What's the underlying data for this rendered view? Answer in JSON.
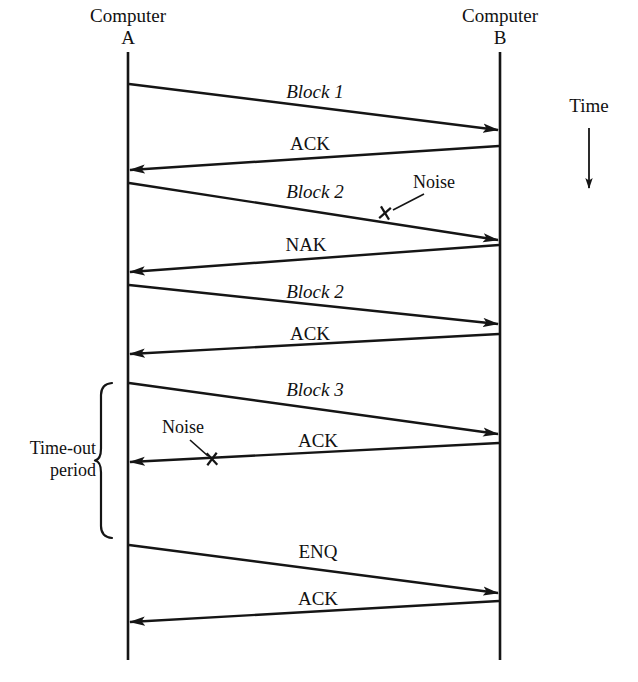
{
  "diagram": {
    "background_color": "#ffffff",
    "ink_color": "#151515",
    "participants": [
      {
        "id": "A",
        "name_line1": "Computer",
        "name_line2": "A",
        "x": 128
      },
      {
        "id": "B",
        "name_line1": "Computer",
        "name_line2": "B",
        "x": 500
      }
    ],
    "time_axis": {
      "label": "Time",
      "direction": "down",
      "x": 589,
      "label_y": 112,
      "arrow_from_y": 128,
      "arrow_to_y": 188
    },
    "messages": [
      {
        "id": "m1",
        "label": "Block 1",
        "style": "italic",
        "from": "A",
        "to": "B",
        "from_y": 84,
        "to_y": 130,
        "label_x": 315,
        "label_y": 98,
        "corrupted": false
      },
      {
        "id": "m2",
        "label": "ACK",
        "style": "roman",
        "from": "B",
        "to": "A",
        "from_y": 146,
        "to_y": 170,
        "label_x": 310,
        "label_y": 150,
        "corrupted": false
      },
      {
        "id": "m3",
        "label": "Block 2",
        "style": "italic",
        "from": "A",
        "to": "B",
        "from_y": 183,
        "to_y": 240,
        "label_x": 315,
        "label_y": 198,
        "corrupted": true,
        "noise": {
          "label": "Noise",
          "mark_x": 385,
          "mark_y": 213,
          "label_x": 434,
          "label_y": 188,
          "leader_from_x": 424,
          "leader_from_y": 194,
          "leader_to_x": 393,
          "leader_to_y": 210
        }
      },
      {
        "id": "m4",
        "label": "NAK",
        "style": "roman",
        "from": "B",
        "to": "A",
        "from_y": 245,
        "to_y": 272,
        "label_x": 306,
        "label_y": 251,
        "corrupted": false
      },
      {
        "id": "m5",
        "label": "Block 2",
        "style": "italic",
        "from": "A",
        "to": "B",
        "from_y": 285,
        "to_y": 324,
        "label_x": 315,
        "label_y": 298,
        "corrupted": false
      },
      {
        "id": "m6",
        "label": "ACK",
        "style": "roman",
        "from": "B",
        "to": "A",
        "from_y": 334,
        "to_y": 354,
        "label_x": 310,
        "label_y": 340,
        "corrupted": false
      },
      {
        "id": "m7",
        "label": "Block 3",
        "style": "italic",
        "from": "A",
        "to": "B",
        "from_y": 383,
        "to_y": 434,
        "label_x": 315,
        "label_y": 396,
        "corrupted": false
      },
      {
        "id": "m8",
        "label": "ACK",
        "style": "roman",
        "from": "B",
        "to": "A",
        "from_y": 443,
        "to_y": 462,
        "label_x": 318,
        "label_y": 447,
        "corrupted": true,
        "noise": {
          "label": "Noise",
          "mark_x": 212,
          "mark_y": 459,
          "label_x": 183,
          "label_y": 433,
          "leader_from_x": 190,
          "leader_from_y": 440,
          "leader_to_x": 208,
          "leader_to_y": 456
        }
      },
      {
        "id": "m9",
        "label": "ENQ",
        "style": "roman",
        "from": "A",
        "to": "B",
        "from_y": 545,
        "to_y": 593,
        "label_x": 318,
        "label_y": 558,
        "corrupted": false
      },
      {
        "id": "m10",
        "label": "ACK",
        "style": "roman",
        "from": "B",
        "to": "A",
        "from_y": 601,
        "to_y": 622,
        "label_x": 318,
        "label_y": 605,
        "corrupted": false
      }
    ],
    "brackets": [
      {
        "id": "timeout",
        "label_line1": "Time-out",
        "label_line2": "period",
        "x": 112,
        "top_y": 383,
        "bottom_y": 538,
        "label_x": 96,
        "label_y1": 454,
        "label_y2": 476
      }
    ],
    "lifeline_top_y": 52,
    "lifeline_bottom_y": 660
  }
}
